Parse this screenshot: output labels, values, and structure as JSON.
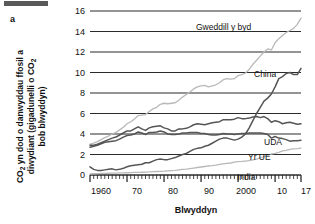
{
  "figure": {
    "panel_letter": "a",
    "top_bar": "redaction-bar"
  },
  "axes": {
    "ylabel_line1": "CO",
    "ylabel_sub1": "2",
    "ylabel_line1b": " yn dod o danwyddau ffosil a",
    "ylabel_line2a": "diwydiant (gigadunelli o CO",
    "ylabel_sub2": "2",
    "ylabel_line3": "bob blwyddyn)",
    "ylabel_full": "CO2 yn dod o danwyddau ffosil a diwydiant (gigadunelli o CO2 bob blwyddyn)",
    "xlabel": "Blwyddyn",
    "yticks": [
      "0",
      "2",
      "4",
      "6",
      "8",
      "10",
      "12",
      "14",
      "16"
    ],
    "xticks": [
      "1960",
      "70",
      "80",
      "90",
      "2000",
      "10",
      "17"
    ]
  },
  "series_labels": {
    "rest_of_world": "Gweddill y byd",
    "china": "China",
    "usa": "UDA",
    "eu": "Yr UE",
    "india": "India"
  },
  "colors": {
    "gridline": "#2b2b2b",
    "axis": "#1a1a1a",
    "dark_series": "#555555",
    "light_series": "#b9b9b9",
    "text": "#111111",
    "top_bar": "#595959"
  },
  "chart_data": {
    "type": "line",
    "title": "",
    "xlabel": "Blwyddyn",
    "ylabel": "CO2 yn dod o danwyddau ffosil a diwydiant (gigadunelli o CO2 bob blwyddyn)",
    "xlim": [
      1960,
      2017
    ],
    "ylim": [
      0,
      16
    ],
    "grid": true,
    "legend_position": "inline-labels",
    "x": [
      1960,
      1961,
      1962,
      1963,
      1964,
      1965,
      1966,
      1967,
      1968,
      1969,
      1970,
      1971,
      1972,
      1973,
      1974,
      1975,
      1976,
      1977,
      1978,
      1979,
      1980,
      1981,
      1982,
      1983,
      1984,
      1985,
      1986,
      1987,
      1988,
      1989,
      1990,
      1991,
      1992,
      1993,
      1994,
      1995,
      1996,
      1997,
      1998,
      1999,
      2000,
      2001,
      2002,
      2003,
      2004,
      2005,
      2006,
      2007,
      2008,
      2009,
      2010,
      2011,
      2012,
      2013,
      2014,
      2015,
      2016,
      2017
    ],
    "series": [
      {
        "name": "Gweddill y byd",
        "color": "#b9b9b9",
        "values": [
          3.0,
          3.1,
          3.25,
          3.45,
          3.65,
          3.8,
          4.0,
          4.15,
          4.4,
          4.65,
          5.0,
          5.2,
          5.45,
          5.8,
          5.85,
          5.9,
          6.2,
          6.45,
          6.6,
          6.9,
          7.0,
          6.95,
          7.0,
          7.05,
          7.3,
          7.6,
          7.85,
          8.1,
          8.4,
          8.6,
          8.7,
          8.75,
          8.6,
          8.7,
          8.8,
          9.0,
          9.3,
          9.4,
          9.35,
          9.4,
          9.7,
          9.8,
          9.95,
          10.3,
          10.8,
          11.2,
          11.6,
          12.0,
          12.3,
          12.2,
          12.9,
          13.3,
          13.6,
          13.9,
          14.1,
          14.3,
          14.7,
          15.3
        ]
      },
      {
        "name": "China",
        "color": "#555555",
        "values": [
          0.8,
          0.55,
          0.45,
          0.45,
          0.5,
          0.55,
          0.6,
          0.5,
          0.55,
          0.65,
          0.8,
          0.9,
          0.95,
          1.0,
          1.05,
          1.2,
          1.2,
          1.35,
          1.5,
          1.55,
          1.5,
          1.5,
          1.6,
          1.7,
          1.85,
          2.0,
          2.1,
          2.3,
          2.5,
          2.6,
          2.65,
          2.8,
          2.9,
          3.1,
          3.3,
          3.5,
          3.6,
          3.6,
          3.5,
          3.4,
          3.5,
          3.7,
          4.0,
          4.6,
          5.3,
          6.0,
          6.6,
          7.2,
          7.5,
          7.9,
          8.6,
          9.4,
          9.6,
          9.9,
          10.0,
          9.8,
          9.8,
          10.4
        ]
      },
      {
        "name": "UDA",
        "color": "#555555",
        "values": [
          2.9,
          2.9,
          3.0,
          3.15,
          3.3,
          3.45,
          3.6,
          3.7,
          3.9,
          4.1,
          4.3,
          4.3,
          4.5,
          4.7,
          4.5,
          4.35,
          4.6,
          4.7,
          4.75,
          4.8,
          4.6,
          4.5,
          4.3,
          4.3,
          4.5,
          4.5,
          4.55,
          4.7,
          4.9,
          5.0,
          4.95,
          4.9,
          5.0,
          5.1,
          5.15,
          5.2,
          5.4,
          5.4,
          5.4,
          5.45,
          5.6,
          5.5,
          5.5,
          5.55,
          5.65,
          5.7,
          5.6,
          5.7,
          5.5,
          5.15,
          5.3,
          5.2,
          5.0,
          5.1,
          5.15,
          5.05,
          4.95,
          5.0
        ]
      },
      {
        "name": "Yr UE",
        "color": "#555555",
        "values": [
          2.7,
          2.8,
          2.9,
          3.05,
          3.2,
          3.25,
          3.3,
          3.35,
          3.5,
          3.7,
          3.85,
          3.9,
          4.0,
          4.2,
          4.1,
          3.95,
          4.15,
          4.15,
          4.2,
          4.3,
          4.2,
          4.0,
          3.95,
          3.95,
          4.0,
          4.1,
          4.1,
          4.15,
          4.15,
          4.15,
          4.05,
          4.05,
          3.95,
          3.9,
          3.9,
          3.95,
          4.05,
          4.0,
          4.0,
          3.95,
          4.0,
          4.05,
          4.05,
          4.1,
          4.1,
          4.1,
          4.1,
          4.05,
          3.95,
          3.6,
          3.75,
          3.6,
          3.55,
          3.45,
          3.3,
          3.35,
          3.35,
          3.4
        ]
      },
      {
        "name": "India",
        "color": "#b9b9b9",
        "values": [
          0.1,
          0.12,
          0.14,
          0.15,
          0.16,
          0.17,
          0.18,
          0.19,
          0.2,
          0.21,
          0.22,
          0.23,
          0.25,
          0.26,
          0.27,
          0.29,
          0.3,
          0.32,
          0.34,
          0.35,
          0.37,
          0.4,
          0.43,
          0.46,
          0.5,
          0.54,
          0.58,
          0.63,
          0.68,
          0.73,
          0.78,
          0.83,
          0.88,
          0.92,
          0.97,
          1.03,
          1.08,
          1.13,
          1.17,
          1.25,
          1.3,
          1.32,
          1.36,
          1.4,
          1.48,
          1.56,
          1.66,
          1.8,
          1.9,
          2.05,
          2.1,
          2.2,
          2.35,
          2.4,
          2.5,
          2.55,
          2.58,
          2.62
        ]
      }
    ]
  }
}
